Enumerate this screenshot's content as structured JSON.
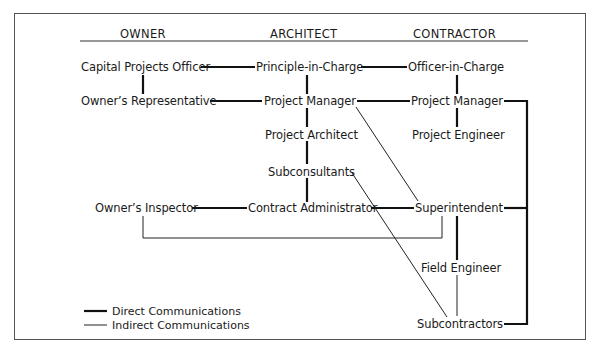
{
  "headers": {
    "owner": "OWNER",
    "architect": "ARCHITECT",
    "contractor": "CONTRACTOR"
  },
  "nodes": {
    "capital_projects_officer": "Capital Projects Officer",
    "owners_representative": "Owner’s Representative",
    "owners_inspector": "Owner’s Inspector",
    "principle_in_charge": "Principle-in-Charge",
    "architect_project_manager": "Project Manager",
    "project_architect": "Project Architect",
    "subconsultants": "Subconsultants",
    "contract_administrator": "Contract Administrator",
    "officer_in_charge": "Officer-in-Charge",
    "contractor_project_manager": "Project Manager",
    "project_engineer": "Project Engineer",
    "superintendent": "Superintendent",
    "field_engineer": "Field Engineer",
    "subcontractors": "Subcontractors"
  },
  "legend": {
    "direct": "Direct Communications",
    "indirect": "Indirect Communications"
  },
  "connections": {
    "direct": [
      [
        "capital_projects_officer",
        "principle_in_charge"
      ],
      [
        "principle_in_charge",
        "officer_in_charge"
      ],
      [
        "capital_projects_officer",
        "owners_representative"
      ],
      [
        "principle_in_charge",
        "architect_project_manager"
      ],
      [
        "officer_in_charge",
        "contractor_project_manager"
      ],
      [
        "owners_representative",
        "architect_project_manager"
      ],
      [
        "architect_project_manager",
        "contractor_project_manager"
      ],
      [
        "architect_project_manager",
        "project_architect"
      ],
      [
        "project_architect",
        "subconsultants"
      ],
      [
        "subconsultants",
        "contract_administrator"
      ],
      [
        "contractor_project_manager",
        "project_engineer"
      ],
      [
        "owners_inspector",
        "contract_administrator"
      ],
      [
        "contract_administrator",
        "superintendent"
      ],
      [
        "superintendent",
        "field_engineer"
      ],
      [
        "contractor_project_manager",
        "superintendent"
      ],
      [
        "contractor_project_manager",
        "subcontractors"
      ]
    ],
    "indirect": [
      [
        "architect_project_manager",
        "superintendent"
      ],
      [
        "subconsultants",
        "subcontractors"
      ],
      [
        "owners_inspector",
        "superintendent"
      ],
      [
        "field_engineer",
        "subcontractors"
      ]
    ]
  }
}
